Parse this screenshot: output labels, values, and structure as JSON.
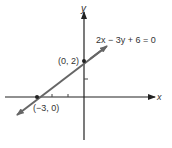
{
  "diagram": {
    "equation": "2x − 3y + 6 = 0",
    "axes": {
      "x_label": "x",
      "y_label": "y"
    },
    "points": [
      {
        "label": "(0, 2)",
        "x": 0,
        "y": 2
      },
      {
        "label": "(−3, 0)",
        "x": -3,
        "y": 0
      }
    ],
    "colors": {
      "axis": "#222222",
      "line": "#666666",
      "text": "#333333"
    }
  }
}
